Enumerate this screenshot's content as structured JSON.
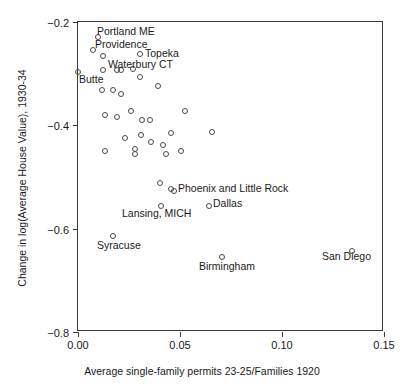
{
  "chart_data": {
    "type": "scatter",
    "title": "",
    "xlabel": "Average single-family permits 23-25/Families 1920",
    "ylabel": "Change in log(Average House Value), 1930-34",
    "xlim": [
      0.0,
      0.15
    ],
    "ylim": [
      -0.8,
      -0.2
    ],
    "grid": false,
    "legend": "none",
    "xticks": [
      "0.00",
      "0.05",
      "0.10",
      "0.15"
    ],
    "xtick_values": [
      0.0,
      0.05,
      0.1,
      0.15
    ],
    "yticks": [
      "-0.2",
      "-0.4",
      "-0.6",
      "-0.8"
    ],
    "ytick_values": [
      -0.2,
      -0.4,
      -0.6,
      -0.8
    ],
    "marker": "open-circle",
    "marker_color": "#4a4a4a",
    "points": [
      {
        "x": 0.0098,
        "y": -0.229,
        "label": "Portland ME"
      },
      {
        "x": 0.0073,
        "y": -0.254,
        "label": "Providence"
      },
      {
        "x": 0.0122,
        "y": -0.266,
        "label": ""
      },
      {
        "x": 0.0305,
        "y": -0.262,
        "label": "Topeka"
      },
      {
        "x": 0.0122,
        "y": -0.292,
        "label": ""
      },
      {
        "x": 0.0191,
        "y": -0.293,
        "label": "Waterbury CT"
      },
      {
        "x": 0.0211,
        "y": -0.293,
        "label": ""
      },
      {
        "x": 0.027,
        "y": -0.291,
        "label": ""
      },
      {
        "x": 0.0,
        "y": -0.297,
        "label": "Butte"
      },
      {
        "x": 0.0304,
        "y": -0.306,
        "label": ""
      },
      {
        "x": 0.0118,
        "y": -0.331,
        "label": ""
      },
      {
        "x": 0.0172,
        "y": -0.331,
        "label": ""
      },
      {
        "x": 0.0211,
        "y": -0.339,
        "label": ""
      },
      {
        "x": 0.0392,
        "y": -0.324,
        "label": ""
      },
      {
        "x": 0.0132,
        "y": -0.38,
        "label": ""
      },
      {
        "x": 0.0191,
        "y": -0.383,
        "label": ""
      },
      {
        "x": 0.026,
        "y": -0.373,
        "label": ""
      },
      {
        "x": 0.0314,
        "y": -0.389,
        "label": ""
      },
      {
        "x": 0.0353,
        "y": -0.389,
        "label": ""
      },
      {
        "x": 0.0525,
        "y": -0.373,
        "label": ""
      },
      {
        "x": 0.0231,
        "y": -0.425,
        "label": ""
      },
      {
        "x": 0.0309,
        "y": -0.419,
        "label": ""
      },
      {
        "x": 0.0358,
        "y": -0.433,
        "label": ""
      },
      {
        "x": 0.0456,
        "y": -0.414,
        "label": ""
      },
      {
        "x": 0.0417,
        "y": -0.439,
        "label": ""
      },
      {
        "x": 0.0132,
        "y": -0.45,
        "label": ""
      },
      {
        "x": 0.028,
        "y": -0.446,
        "label": ""
      },
      {
        "x": 0.028,
        "y": -0.456,
        "label": ""
      },
      {
        "x": 0.0432,
        "y": -0.456,
        "label": ""
      },
      {
        "x": 0.0505,
        "y": -0.45,
        "label": ""
      },
      {
        "x": 0.0657,
        "y": -0.412,
        "label": ""
      },
      {
        "x": 0.0402,
        "y": -0.512,
        "label": ""
      },
      {
        "x": 0.0456,
        "y": -0.523,
        "label": "Phoenix and Little Rock"
      },
      {
        "x": 0.0471,
        "y": -0.528,
        "label": ""
      },
      {
        "x": 0.0407,
        "y": -0.556,
        "label": "Lansing, MICH"
      },
      {
        "x": 0.0643,
        "y": -0.556,
        "label": "Dallas"
      },
      {
        "x": 0.0172,
        "y": -0.614,
        "label": "Syracuse"
      },
      {
        "x": 0.0706,
        "y": -0.655,
        "label": "Birmingham"
      },
      {
        "x": 0.1343,
        "y": -0.644,
        "label": "San Diego"
      }
    ],
    "annotations": [
      {
        "text": "Portland ME",
        "x": 97,
        "y": 25
      },
      {
        "text": "Providence",
        "x": 95,
        "y": 38
      },
      {
        "text": "Topeka",
        "x": 145,
        "y": 47
      },
      {
        "text": "Waterbury CT",
        "x": 108,
        "y": 58
      },
      {
        "text": "Butte",
        "x": 79,
        "y": 73
      },
      {
        "text": "Phoenix and Little Rock",
        "x": 178,
        "y": 182
      },
      {
        "text": "Dallas",
        "x": 213,
        "y": 197
      },
      {
        "text": "Lansing, MICH",
        "x": 122,
        "y": 207
      },
      {
        "text": "Syracuse",
        "x": 97,
        "y": 239
      },
      {
        "text": "Birmingham",
        "x": 199,
        "y": 260
      },
      {
        "text": "San Diego",
        "x": 322,
        "y": 250
      }
    ]
  },
  "axes": {
    "x_title": "Average single-family permits 23-25/Families 1920",
    "y_title": "Change in log(Average House Value), 1930-34",
    "x_ticks": [
      "0.00",
      "0.05",
      "0.10",
      "0.15"
    ],
    "y_ticks": [
      "-0.2",
      "-0.4",
      "-0.6",
      "-0.8"
    ]
  }
}
